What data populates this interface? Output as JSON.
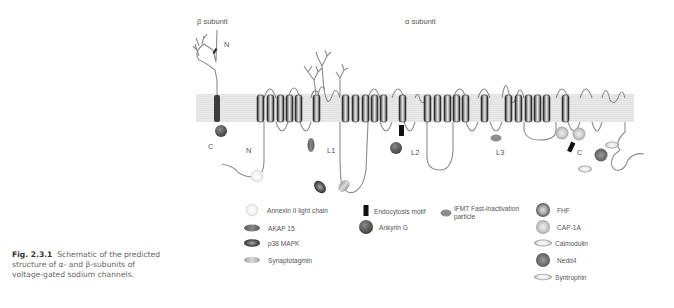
{
  "labels": {
    "beta_subunit": "β subunit",
    "alpha_subunit": "α subunit",
    "beta_N": "N",
    "beta_C": "C",
    "alpha_N": "N",
    "alpha_C": "C",
    "L1": "L1",
    "L2": "L2",
    "L3": "L3"
  },
  "caption": {
    "number": "Fig. 2.3.1",
    "text_line1": "Schematic of the predicted",
    "text_line2": "structure of α- and β-subunits of",
    "text_line3": "voltage-gated sodium channels."
  },
  "legend": [
    {
      "label": "Annexin II light chain",
      "shape": "circle-light"
    },
    {
      "label": "AKAP 15",
      "shape": "ellipse-dark"
    },
    {
      "label": "p38 MAPK",
      "shape": "ellipse-dark-center"
    },
    {
      "label": "Synaptotagmin",
      "shape": "ellipse-light"
    },
    {
      "label": "Endocytosis motif",
      "shape": "black-bar"
    },
    {
      "label": "Ankyrin G",
      "shape": "circle-dark"
    },
    {
      "label": "IFMT Fast-inactivation",
      "label2": "particle",
      "shape": "ellipse-small-grey"
    },
    {
      "label": "FHF",
      "shape": "circle-ring-dark"
    },
    {
      "label": "CAP-1A",
      "shape": "circle-ring-light"
    },
    {
      "label": "Calmodulin",
      "shape": "ellipse-ring"
    },
    {
      "label": "Nedd4",
      "shape": "circle-mid"
    },
    {
      "label": "Syntrophin",
      "shape": "ellipse-ring-light"
    }
  ],
  "colors": {
    "membrane": "#e6e6e6",
    "segment_dark": "#2a2a2a",
    "loop": "#8a8a8a",
    "text": "#555555"
  }
}
